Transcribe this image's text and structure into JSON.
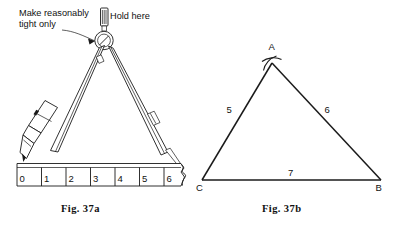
{
  "figure": {
    "panels": [
      {
        "id": "fig-37a",
        "caption": "Fig.  37a",
        "annotations": [
          {
            "name": "tightness-note",
            "line1": "Make reasonably",
            "line2": "tight only"
          },
          {
            "name": "hold-note",
            "text": "Hold here"
          }
        ],
        "ruler": {
          "name": "ruler",
          "marks": [
            "0",
            "1",
            "2",
            "3",
            "4",
            "5",
            "6"
          ],
          "broken_end": true
        },
        "instrument": {
          "name": "compass",
          "parts": [
            "knurled-handle",
            "pivot-hinge",
            "pencil-leg",
            "point-leg",
            "pencil"
          ]
        }
      },
      {
        "id": "fig-37b",
        "caption": "Fig.  37b",
        "triangle": {
          "name": "triangle-abc",
          "vertices": [
            {
              "label": "A",
              "x": 272,
              "y": 63
            },
            {
              "label": "B",
              "x": 381,
              "y": 180
            },
            {
              "label": "C",
              "x": 202,
              "y": 180
            }
          ],
          "sides": [
            {
              "name": "side-ca",
              "label": "5",
              "from": "C",
              "to": "A"
            },
            {
              "name": "side-ab",
              "label": "6",
              "from": "A",
              "to": "B"
            },
            {
              "name": "side-cb",
              "label": "7",
              "from": "C",
              "to": "B"
            }
          ],
          "arc_marks_at": "A"
        }
      }
    ]
  },
  "colors": {
    "ink": "#1a1a1a",
    "paper": "#ffffff",
    "text": "#111111"
  }
}
